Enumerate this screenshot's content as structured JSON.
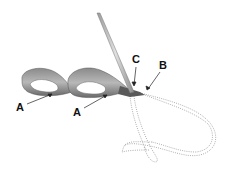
{
  "diagram": {
    "labels": {
      "a1": "A",
      "a2": "A",
      "b": "B",
      "c": "C"
    },
    "colors": {
      "ribbon_light": "#b4b4b4",
      "ribbon_dark": "#6e6e6e",
      "needle": "#c8c8c8",
      "outline_dotted": "#9a9a9a",
      "label": "#111111"
    }
  }
}
